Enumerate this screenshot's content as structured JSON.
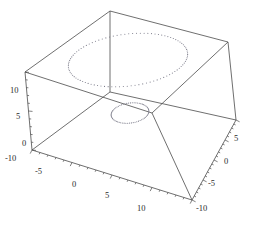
{
  "figure": {
    "kind": "mathematica-3d-plot",
    "background_color": "#ffffff",
    "line_color": "#4a4a4a",
    "dot_color": "#7a7a88",
    "width": 265,
    "height": 225
  },
  "chart_data": {
    "type": "scatter",
    "title": "",
    "xlabel": "",
    "ylabel": "",
    "zlabel": "",
    "projection": "3d-orthographic-box",
    "grid": false,
    "legend": null,
    "axes": {
      "x": {
        "name": "x-axis",
        "position": "bottom-left-edge",
        "lim": [
          -10,
          10
        ],
        "ticks": [
          -10,
          -5,
          0,
          5,
          10
        ],
        "tick_labels": [
          "-10",
          "-5",
          "0",
          "5",
          "10"
        ],
        "minor_ticks_per_interval": 4
      },
      "y": {
        "name": "y-axis",
        "position": "bottom-right-edge",
        "lim": [
          -10,
          10
        ],
        "ticks": [
          5,
          0,
          -5,
          -10
        ],
        "tick_labels": [
          "5",
          "0",
          "-5",
          "-10"
        ],
        "minor_ticks_per_interval": 4
      },
      "z": {
        "name": "z-axis",
        "position": "left-vertical-edge",
        "lim": [
          0,
          10
        ],
        "ticks": [
          10,
          5,
          0
        ],
        "tick_labels": [
          "10",
          "5",
          "0"
        ],
        "minor_ticks_per_interval": 4
      }
    },
    "series": [
      {
        "name": "outer-ring",
        "style": "dotted-ellipse",
        "marker": "point",
        "radius": 8.0,
        "z": 6.2,
        "n_points": 96,
        "center": [
          0,
          0
        ]
      },
      {
        "name": "inner-ring",
        "style": "dotted-ellipse",
        "marker": "point",
        "radius": 2.6,
        "z": 1.4,
        "n_points": 64,
        "center": [
          0,
          0
        ]
      }
    ]
  },
  "geometry": {
    "box_corners_px": {
      "back_top": [
        110,
        11
      ],
      "left_top": [
        25,
        72
      ],
      "right_top": [
        228,
        42
      ],
      "front_top": [
        152,
        113
      ],
      "left_bottom": [
        32,
        150
      ],
      "right_bottom": [
        236,
        120
      ],
      "front_bottom": [
        192,
        200
      ],
      "back_bottom": [
        110,
        92
      ]
    },
    "outer_ring_px": {
      "cx": 128,
      "cy": 60,
      "rx": 60,
      "ry": 26,
      "skew_deg": -7
    },
    "inner_ring_px": {
      "cx": 130,
      "cy": 113,
      "rx": 19,
      "ry": 10,
      "skew_deg": -8
    }
  },
  "tick_labels_px": {
    "z": [
      {
        "text": "10",
        "x": 10,
        "y": 93
      },
      {
        "text": "5",
        "x": 16,
        "y": 119
      },
      {
        "text": "0",
        "x": 22,
        "y": 146
      }
    ],
    "x": [
      {
        "text": "-10",
        "x": 5,
        "y": 161
      },
      {
        "text": "-5",
        "x": 35,
        "y": 174
      },
      {
        "text": "0",
        "x": 72,
        "y": 187
      },
      {
        "text": "5",
        "x": 105,
        "y": 198
      },
      {
        "text": "10",
        "x": 137,
        "y": 211
      }
    ],
    "y": [
      {
        "text": "5",
        "x": 234,
        "y": 141
      },
      {
        "text": "0",
        "x": 224,
        "y": 164
      },
      {
        "text": "-5",
        "x": 208,
        "y": 186
      },
      {
        "text": "-10",
        "x": 196,
        "y": 211
      }
    ]
  }
}
